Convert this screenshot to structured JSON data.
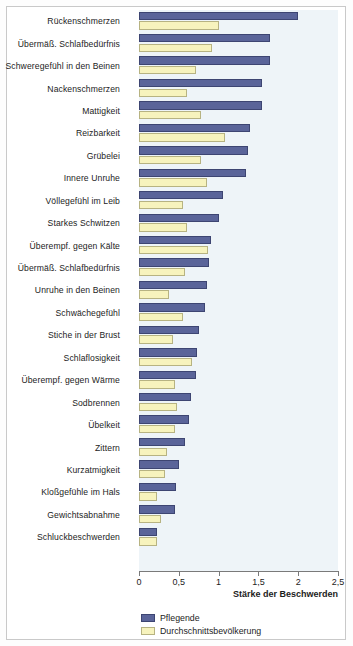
{
  "chart_data": {
    "type": "bar",
    "orientation": "horizontal",
    "title": "",
    "xlabel": "Stärke der Beschwerden",
    "ylabel": "",
    "xlim": [
      0,
      2.5
    ],
    "xticks": [
      0,
      0.5,
      1,
      1.5,
      2,
      2.5
    ],
    "xtick_labels": [
      "0",
      "0,5",
      "1",
      "1,5",
      "2",
      "2,5"
    ],
    "grid": false,
    "legend_position": "below-axis-left",
    "categories": [
      "Rückenschmerzen",
      "Übermäß. Schlafbedürfnis",
      "Schweregefühl in den Beinen",
      "Nackenschmerzen",
      "Mattigkeit",
      "Reizbarkeit",
      "Grübelei",
      "Innere Unruhe",
      "Völlegefühl im Leib",
      "Starkes Schwitzen",
      "Überempf. gegen Kälte",
      "Übermäß. Schlafbedürfnis",
      "Unruhe in den Beinen",
      "Schwächegefühl",
      "Stiche in der Brust",
      "Schlaflosigkeit",
      "Überempf. gegen Wärme",
      "Sodbrennen",
      "Übelkeit",
      "Zittern",
      "Kurzatmigkeit",
      "Kloßgefühle im Hals",
      "Gewichtsabnahme",
      "Schluckbeschwerden"
    ],
    "series": [
      {
        "name": "Pflegende",
        "color": "#5a6499",
        "values": [
          2.0,
          1.65,
          1.65,
          1.55,
          1.55,
          1.4,
          1.37,
          1.35,
          1.05,
          1.0,
          0.9,
          0.88,
          0.85,
          0.83,
          0.75,
          0.73,
          0.72,
          0.65,
          0.63,
          0.58,
          0.5,
          0.47,
          0.45,
          0.23
        ]
      },
      {
        "name": "Durchschnittsbevölkerung",
        "color": "#f7f3bd",
        "values": [
          1.0,
          0.92,
          0.72,
          0.6,
          0.78,
          1.08,
          0.78,
          0.85,
          0.55,
          0.6,
          0.87,
          0.58,
          0.38,
          0.55,
          0.43,
          0.67,
          0.45,
          0.48,
          0.45,
          0.35,
          0.33,
          0.22,
          0.28,
          0.22
        ]
      }
    ]
  },
  "legend": {
    "items": [
      {
        "label": "Pflegende"
      },
      {
        "label": "Durchschnittsbevölkerung"
      }
    ]
  }
}
